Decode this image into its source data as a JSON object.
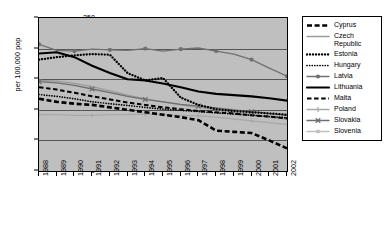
{
  "chart_data": {
    "type": "line",
    "title": "",
    "xlabel": "",
    "ylabel": "per 100,000 pop",
    "ylim": [
      0,
      250
    ],
    "yticks": [
      0,
      50,
      100,
      150,
      200,
      250
    ],
    "grid": true,
    "legend_position": "right",
    "plot_background": "#bfbfbf",
    "x": [
      1988,
      1989,
      1990,
      1991,
      1992,
      1993,
      1994,
      1995,
      1996,
      1997,
      1998,
      1999,
      2000,
      2001,
      2002
    ],
    "categories": [
      "1988",
      "1989",
      "1990",
      "1991",
      "1992",
      "1993",
      "1994",
      "1995",
      "1996",
      "1997",
      "1998",
      "1999",
      "2000",
      "2001",
      "2002"
    ],
    "series": [
      {
        "name": "Cyprus",
        "style": "thick-dashed",
        "color": "#000000",
        "marker": "none",
        "values": [
          118,
          113,
          110,
          108,
          104,
          100,
          96,
          92,
          88,
          83,
          66,
          64,
          62,
          50,
          37
        ]
      },
      {
        "name": "Czech Republic",
        "style": "solid",
        "color": "#9a9a9a",
        "marker": "none",
        "values": [
          148,
          147,
          143,
          138,
          131,
          124,
          118,
          113,
          108,
          104,
          100,
          96,
          92,
          88,
          85
        ]
      },
      {
        "name": "Estonia",
        "style": "dotted-bold",
        "color": "#000000",
        "marker": "none",
        "values": [
          182,
          186,
          189,
          191,
          190,
          160,
          148,
          152,
          120,
          108,
          101,
          98,
          96,
          94,
          92
        ]
      },
      {
        "name": "Hungary",
        "style": "dotted",
        "color": "#000000",
        "marker": "none",
        "values": [
          125,
          122,
          118,
          113,
          110,
          107,
          104,
          101,
          99,
          97,
          95,
          93,
          91,
          89,
          87
        ]
      },
      {
        "name": "Latvia",
        "style": "solid-marker",
        "color": "#707070",
        "marker": "circle",
        "values": [
          207,
          197,
          196,
          199,
          198,
          197,
          200,
          196,
          199,
          201,
          196,
          191,
          182,
          168,
          155
        ]
      },
      {
        "name": "Lithuania",
        "style": "solid-thick",
        "color": "#000000",
        "marker": "none",
        "values": [
          192,
          194,
          186,
          172,
          160,
          150,
          148,
          143,
          137,
          130,
          126,
          124,
          122,
          119,
          115
        ]
      },
      {
        "name": "Malta",
        "style": "dashed",
        "color": "#000000",
        "marker": "none",
        "values": [
          137,
          133,
          128,
          122,
          117,
          112,
          108,
          104,
          101,
          98,
          96,
          94,
          91,
          89,
          86
        ]
      },
      {
        "name": "Poland",
        "style": "solid-marker",
        "color": "#a8a8a8",
        "marker": "plus",
        "values": [
          92,
          92,
          91,
          91,
          92,
          92,
          93,
          92,
          91,
          90,
          88,
          85,
          82,
          79,
          76
        ]
      },
      {
        "name": "Slovakia",
        "style": "solid-marker",
        "color": "#6e6e6e",
        "marker": "cross",
        "values": [
          146,
          144,
          140,
          134,
          128,
          122,
          117,
          113,
          109,
          106,
          103,
          100,
          97,
          94,
          91
        ]
      },
      {
        "name": "Slovenia",
        "style": "solid-marker",
        "color": "#c0c0c0",
        "marker": "circle",
        "values": [
          88,
          89,
          90,
          90,
          90,
          91,
          92,
          91,
          90,
          89,
          87,
          85,
          83,
          81,
          79
        ]
      }
    ]
  },
  "axis": {
    "y_title": "per 100,000 pop",
    "y_labels": [
      "250",
      "200",
      "150",
      "100",
      "50",
      "0"
    ],
    "x_labels": [
      "1988",
      "1989",
      "1990",
      "1991",
      "1992",
      "1993",
      "1994",
      "1995",
      "1996",
      "1997",
      "1998",
      "1999",
      "2000",
      "2001",
      "2002"
    ]
  },
  "legend": {
    "items": [
      {
        "label": "Cyprus"
      },
      {
        "label": "Czech\nRepublic"
      },
      {
        "label": "Estonia"
      },
      {
        "label": "Hungary"
      },
      {
        "label": "Latvia"
      },
      {
        "label": "Lithuania"
      },
      {
        "label": "Malta"
      },
      {
        "label": "Poland"
      },
      {
        "label": "Slovakia"
      },
      {
        "label": "Slovenia"
      }
    ]
  }
}
